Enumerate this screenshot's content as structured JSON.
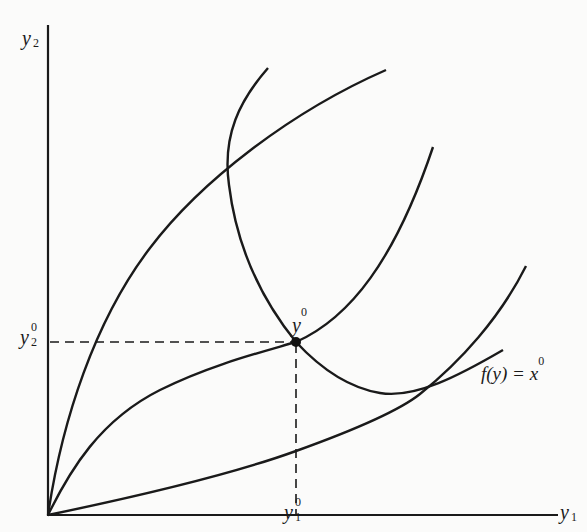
{
  "diagram": {
    "type": "production-possibility / output-distance diagram",
    "axes": {
      "x_label": "y",
      "x_label_sub": "1",
      "y_label": "y",
      "y_label_sub": "2"
    },
    "ticks": {
      "x_tick": "y",
      "x_tick_sub": "1",
      "x_tick_sup": "0",
      "y_tick": "y",
      "y_tick_sub": "2",
      "y_tick_sup": "0"
    },
    "point": {
      "label": "y",
      "label_sup": "0"
    },
    "curve_label": {
      "text": "f(y) = x",
      "sup": "0"
    },
    "colors": {
      "ink": "#1a1a1a",
      "background": "#fbfbfa"
    }
  }
}
